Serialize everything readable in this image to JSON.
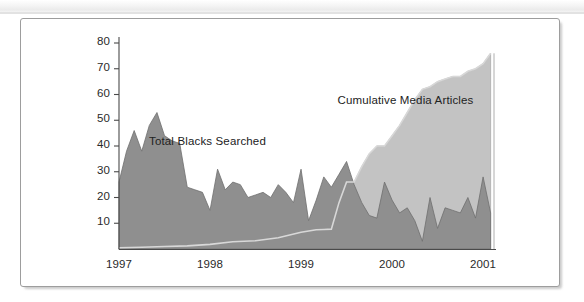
{
  "figure": {
    "type": "area-chart",
    "frame": {
      "border_color": "#9d9d9d",
      "background": "#ffffff"
    }
  },
  "chart_data": {
    "type": "area",
    "title": "",
    "subtitle": "",
    "xlabel": "",
    "ylabel": "",
    "grid": false,
    "legend_position": "inline-annotation",
    "xlim": [
      1997.0,
      2001.12
    ],
    "ylim": [
      0,
      80
    ],
    "yticks": [
      10,
      20,
      30,
      40,
      50,
      60,
      70,
      80
    ],
    "xticks": [
      1997,
      1998,
      1999,
      2000,
      2001
    ],
    "xtick_labels": [
      "1997",
      "1998",
      "1999",
      "2000",
      "2001"
    ],
    "ytick_labels": [
      "10",
      "20",
      "30",
      "40",
      "50",
      "60",
      "70",
      "80"
    ],
    "colors": {
      "total_blacks_searched": "#8f8f8f",
      "cumulative_media_articles": "#c3c3c3",
      "axis": "#4a4a4a",
      "series_outline": "#6e6e6e"
    },
    "series": [
      {
        "name": "Total Blacks Searched",
        "fill": "#8f8f8f",
        "label_x": 1997.33,
        "label_y": 41,
        "x": [
          1997.0,
          1997.083,
          1997.167,
          1997.25,
          1997.333,
          1997.417,
          1997.5,
          1997.583,
          1997.667,
          1997.75,
          1997.833,
          1997.917,
          1998.0,
          1998.083,
          1998.167,
          1998.25,
          1998.333,
          1998.417,
          1998.5,
          1998.583,
          1998.667,
          1998.75,
          1998.833,
          1998.917,
          1999.0,
          1999.083,
          1999.167,
          1999.25,
          1999.333,
          1999.417,
          1999.5,
          1999.583,
          1999.667,
          1999.75,
          1999.833,
          1999.917,
          2000.0,
          2000.083,
          2000.167,
          2000.25,
          2000.333,
          2000.417,
          2000.5,
          2000.583,
          2000.667,
          2000.75,
          2000.833,
          2000.917,
          2001.0,
          2001.083
        ],
        "values": [
          26,
          38,
          46,
          38,
          48,
          53,
          44,
          42,
          41,
          24,
          23,
          22,
          15,
          31,
          23,
          26,
          25,
          20,
          21,
          22,
          20,
          25,
          22,
          18,
          31,
          11,
          19,
          28,
          24,
          29,
          34,
          25,
          18,
          13,
          12,
          26,
          19,
          14,
          16,
          11,
          3,
          20,
          8,
          16,
          15,
          14,
          20,
          12,
          28,
          14
        ]
      },
      {
        "name": "Cumulative Media Articles",
        "fill": "#c3c3c3",
        "label_x": 1999.4,
        "label_y": 57,
        "x": [
          1997.0,
          1997.25,
          1997.5,
          1997.75,
          1998.0,
          1998.25,
          1998.5,
          1998.75,
          1999.0,
          1999.167,
          1999.25,
          1999.333,
          1999.417,
          1999.5,
          1999.583,
          1999.667,
          1999.75,
          1999.833,
          1999.917,
          2000.0,
          2000.083,
          2000.167,
          2000.25,
          2000.333,
          2000.417,
          2000.5,
          2000.583,
          2000.667,
          2000.75,
          2000.833,
          2000.917,
          2001.0,
          2001.083
        ],
        "values": [
          0.5,
          0.7,
          1.0,
          1.2,
          1.8,
          2.8,
          3.2,
          4.4,
          6.5,
          7.5,
          7.6,
          7.7,
          18,
          26,
          26,
          32,
          37,
          40,
          40,
          44,
          48,
          53,
          58,
          62,
          63,
          65,
          66,
          67,
          67,
          69,
          70,
          72,
          76
        ]
      }
    ],
    "annotations": [
      {
        "text": "Total Blacks Searched",
        "x": 1997.33,
        "y": 41
      },
      {
        "text": "Cumulative Media Articles",
        "x": 1999.4,
        "y": 57
      }
    ]
  }
}
